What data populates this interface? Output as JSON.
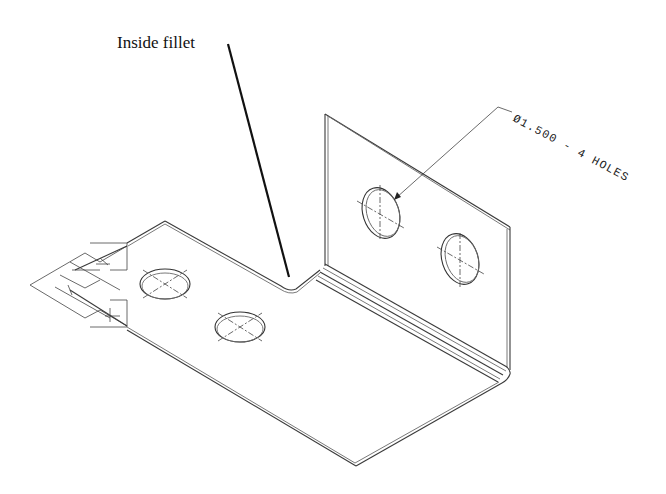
{
  "drawing": {
    "type": "isometric sheet-metal bracket",
    "annotations": {
      "fillet_label": "Inside fillet",
      "hole_callout": "Ø1.500 - 4 HOLES"
    },
    "features": {
      "holes_on_base": 2,
      "holes_on_flange": 2,
      "total_holes": 4,
      "hole_diameter": "1.500"
    },
    "colors": {
      "background": "#ffffff",
      "line": "#3a3a3a",
      "text": "#111111"
    }
  }
}
